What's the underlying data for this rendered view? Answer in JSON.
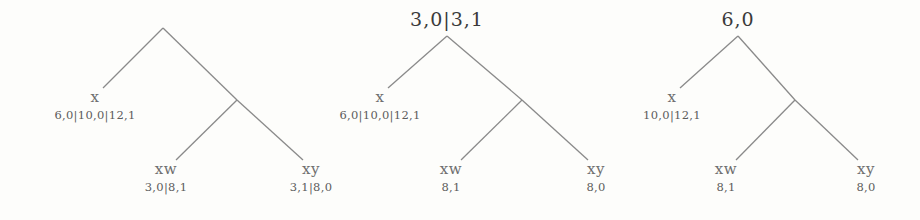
{
  "diagram": {
    "background_color": "#fdfdfb",
    "edge_color": "#8a8a8a",
    "text_color": "#5c5c5c",
    "root_text_color": "#3a3a3a",
    "trees": [
      {
        "id": "tree-1",
        "root": {
          "label": "",
          "x": 163,
          "y": 28
        },
        "internal": {
          "x": 237,
          "y": 100
        },
        "nodes": [
          {
            "id": "tree-1-node-x",
            "name": "x",
            "label": "6,0|10,0|12,1",
            "x": 95,
            "y": 90
          },
          {
            "id": "tree-1-node-xw",
            "name": "xw",
            "label": "3,0|8,1",
            "x": 166,
            "y": 162
          },
          {
            "id": "tree-1-node-xy",
            "name": "xy",
            "label": "3,1|8,0",
            "x": 311,
            "y": 162
          }
        ]
      },
      {
        "id": "tree-2",
        "root": {
          "label": "3,0|3,1",
          "x": 447,
          "y": 8,
          "apex_x": 447,
          "apex_y": 36
        },
        "internal": {
          "x": 522,
          "y": 100
        },
        "nodes": [
          {
            "id": "tree-2-node-x",
            "name": "x",
            "label": "6,0|10,0|12,1",
            "x": 380,
            "y": 90
          },
          {
            "id": "tree-2-node-xw",
            "name": "xw",
            "label": "8,1",
            "x": 451,
            "y": 162
          },
          {
            "id": "tree-2-node-xy",
            "name": "xy",
            "label": "8,0",
            "x": 596,
            "y": 162
          }
        ]
      },
      {
        "id": "tree-3",
        "root": {
          "label": "6,0",
          "x": 738,
          "y": 8,
          "apex_x": 738,
          "apex_y": 36
        },
        "internal": {
          "x": 795,
          "y": 100
        },
        "nodes": [
          {
            "id": "tree-3-node-x",
            "name": "x",
            "label": "10,0|12,1",
            "x": 672,
            "y": 90
          },
          {
            "id": "tree-3-node-xw",
            "name": "xw",
            "label": "8,1",
            "x": 726,
            "y": 162
          },
          {
            "id": "tree-3-node-xy",
            "name": "xy",
            "label": "8,0",
            "x": 866,
            "y": 162
          }
        ]
      }
    ]
  }
}
